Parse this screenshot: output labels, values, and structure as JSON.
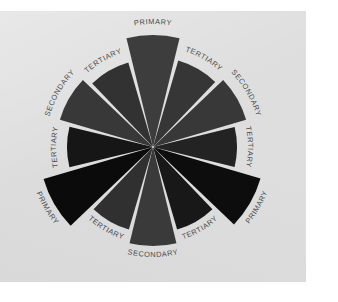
{
  "figure": {
    "name": "color-wheel-category-diagram",
    "background_color": "#ffffff",
    "card_color": "#dedede",
    "gap_color": "#dedede",
    "label_color": "#4a4a4a"
  },
  "chart_data": {
    "type": "pie",
    "title": "",
    "subtitle": "",
    "xlabel": "",
    "ylabel": "",
    "legend_position": "none",
    "grid": false,
    "note": "Twelve-spoke color wheel: 12 equal wedges of 30 degrees each, alternating primary / secondary / tertiary classification, rendered in grayscale tones.",
    "center": {
      "x": 153,
      "y": 136
    },
    "inner_radius": 0,
    "wedge_count": 12,
    "wedge_angle_deg": 30,
    "categories": [
      "PRIMARY",
      "TERTIARY",
      "SECONDARY",
      "TERTIARY",
      "PRIMARY",
      "TERTIARY",
      "SECONDARY",
      "TERTIARY",
      "PRIMARY",
      "TERTIARY",
      "SECONDARY",
      "TERTIARY"
    ],
    "values": [
      1,
      1,
      1,
      1,
      1,
      1,
      1,
      1,
      1,
      1,
      1,
      1
    ],
    "series": [
      {
        "name": "wedge tone",
        "values": [
          61,
          54,
          56,
          35,
          13,
          22,
          58,
          47,
          12,
          35,
          58,
          51
        ]
      }
    ],
    "wedges": [
      {
        "index": 0,
        "label": "PRIMARY",
        "class": "primary",
        "center_angle_deg": 0,
        "radius": 112,
        "color": "#3d3d3d"
      },
      {
        "index": 1,
        "label": "TERTIARY",
        "class": "tertiary",
        "center_angle_deg": 30,
        "radius": 90,
        "color": "#363636"
      },
      {
        "index": 2,
        "label": "SECONDARY",
        "class": "secondary",
        "center_angle_deg": 60,
        "radius": 97,
        "color": "#383838"
      },
      {
        "index": 3,
        "label": "TERTIARY",
        "class": "tertiary",
        "center_angle_deg": 90,
        "radius": 84,
        "color": "#232323"
      },
      {
        "index": 4,
        "label": "PRIMARY",
        "class": "primary",
        "center_angle_deg": 120,
        "radius": 112,
        "color": "#0d0d0d"
      },
      {
        "index": 5,
        "label": "TERTIARY",
        "class": "tertiary",
        "center_angle_deg": 150,
        "radius": 86,
        "color": "#181818"
      },
      {
        "index": 6,
        "label": "SECONDARY",
        "class": "secondary",
        "center_angle_deg": 180,
        "radius": 99,
        "color": "#3a3a3a"
      },
      {
        "index": 7,
        "label": "TERTIARY",
        "class": "tertiary",
        "center_angle_deg": 210,
        "radius": 86,
        "color": "#303030"
      },
      {
        "index": 8,
        "label": "PRIMARY",
        "class": "primary",
        "center_angle_deg": 240,
        "radius": 114,
        "color": "#0b0b0b"
      },
      {
        "index": 9,
        "label": "TERTIARY",
        "class": "tertiary",
        "center_angle_deg": 270,
        "radius": 86,
        "color": "#161616"
      },
      {
        "index": 10,
        "label": "SECONDARY",
        "class": "secondary",
        "center_angle_deg": 300,
        "radius": 97,
        "color": "#383838"
      },
      {
        "index": 11,
        "label": "TERTIARY",
        "class": "tertiary",
        "center_angle_deg": 330,
        "radius": 88,
        "color": "#323232"
      }
    ]
  }
}
